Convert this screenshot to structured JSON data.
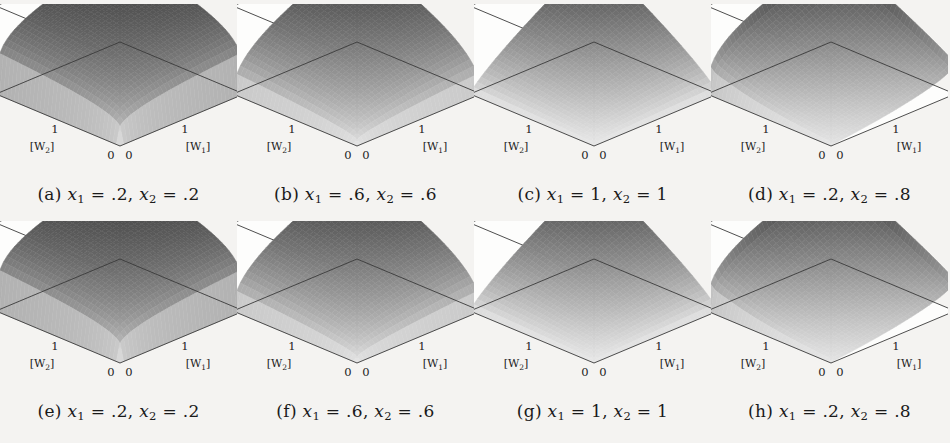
{
  "figure": {
    "background_color": "#f4f3f1",
    "ink_color": "#1a1a1a",
    "rows": 2,
    "cols": 4
  },
  "axes": {
    "zlabel_parts": {
      "num": "|Y|",
      "slash": "/(",
      "x1": "|X",
      "x1sub": "1",
      "plus": "| + |X",
      "x2sub": "2",
      "close": "|)"
    },
    "zlabel_text": "|Y|/(|X1| + |X2|)",
    "z_ticks": [
      "0",
      "0.5",
      "1"
    ],
    "z_tick_values": [
      0,
      0.5,
      1
    ],
    "w1_label_parts": {
      "open": "[W",
      "sub": "1",
      "close": "]"
    },
    "w2_label_parts": {
      "open": "[W",
      "sub": "2",
      "close": "]"
    },
    "w1_label_text": "[W1]",
    "w2_label_text": "[W2]",
    "w1_ticks": [
      "0",
      "1",
      "2"
    ],
    "w2_ticks": [
      "0",
      "1",
      "2"
    ],
    "w_range": [
      0,
      2
    ],
    "z_range": [
      0,
      1
    ]
  },
  "panels": [
    {
      "key": "a",
      "tag": "(a)",
      "x1": ".2",
      "x2": ".2",
      "caption_text": "(a) x1 = .2, x2 = .2",
      "shape": "peaked",
      "surface": {
        "plateau_height": 1.0,
        "valley_height": 0.02,
        "ridge_sharpness": "sharp",
        "asymmetric": false,
        "front_apex_z": 0.0,
        "back_apex_z": 1.0,
        "left_edge_z": [
          0.02,
          1.0
        ],
        "right_edge_z": [
          0.02,
          1.0
        ]
      }
    },
    {
      "key": "b",
      "tag": "(b)",
      "x1": ".6",
      "x2": ".6",
      "caption_text": "(b) x1 = .6, x2 = .6",
      "shape": "rounded-plateau",
      "surface": {
        "plateau_height": 0.98,
        "valley_height": 0.03,
        "ridge_sharpness": "medium",
        "asymmetric": false,
        "front_apex_z": 0.0,
        "back_apex_z": 1.0,
        "left_edge_z": [
          0.03,
          0.95
        ],
        "right_edge_z": [
          0.03,
          0.95
        ]
      }
    },
    {
      "key": "c",
      "tag": "(c)",
      "x1": "1",
      "x2": "1",
      "caption_text": "(c) x1 = 1, x2 = 1",
      "shape": "dome",
      "surface": {
        "plateau_height": 0.95,
        "valley_height": 0.04,
        "ridge_sharpness": "smooth",
        "asymmetric": false,
        "front_apex_z": 0.0,
        "back_apex_z": 1.0,
        "left_edge_z": [
          0.04,
          0.88
        ],
        "right_edge_z": [
          0.04,
          0.88
        ]
      }
    },
    {
      "key": "d",
      "tag": "(d)",
      "x1": ".2",
      "x2": ".8",
      "caption_text": "(d) x1 = .2, x2 = .8",
      "shape": "asymmetric-valley",
      "surface": {
        "plateau_height": 1.0,
        "valley_height": 0.0,
        "ridge_sharpness": "sharp",
        "asymmetric": true,
        "front_apex_z": 0.0,
        "back_apex_z": 1.0,
        "left_edge_z": [
          0.0,
          0.62
        ],
        "right_edge_z": [
          0.0,
          1.0
        ],
        "cutout": true
      }
    },
    {
      "key": "e",
      "tag": "(e)",
      "x1": ".2",
      "x2": ".2",
      "caption_text": "(e) x1 = .2, x2 = .2",
      "shape": "peaked",
      "surface": {
        "plateau_height": 1.0,
        "valley_height": 0.02,
        "ridge_sharpness": "sharp",
        "asymmetric": false,
        "front_apex_z": 0.0,
        "back_apex_z": 1.0,
        "left_edge_z": [
          0.02,
          1.0
        ],
        "right_edge_z": [
          0.02,
          1.0
        ]
      }
    },
    {
      "key": "f",
      "tag": "(f)",
      "x1": ".6",
      "x2": ".6",
      "caption_text": "(f) x1 = .6, x2 = .6",
      "shape": "rounded-plateau",
      "surface": {
        "plateau_height": 0.96,
        "valley_height": 0.04,
        "ridge_sharpness": "medium",
        "asymmetric": false,
        "front_apex_z": 0.0,
        "back_apex_z": 1.0,
        "left_edge_z": [
          0.04,
          0.9
        ],
        "right_edge_z": [
          0.04,
          0.9
        ]
      }
    },
    {
      "key": "g",
      "tag": "(g)",
      "x1": "1",
      "x2": "1",
      "caption_text": "(g) x1 = 1, x2 = 1",
      "shape": "dome",
      "surface": {
        "plateau_height": 0.9,
        "valley_height": 0.05,
        "ridge_sharpness": "smooth",
        "asymmetric": false,
        "front_apex_z": 0.0,
        "back_apex_z": 1.0,
        "left_edge_z": [
          0.05,
          0.8
        ],
        "right_edge_z": [
          0.05,
          0.8
        ]
      }
    },
    {
      "key": "h",
      "tag": "(h)",
      "x1": ".2",
      "x2": ".8",
      "caption_text": "(h) x1 = .2, x2 = .8",
      "shape": "asymmetric-valley",
      "surface": {
        "plateau_height": 1.0,
        "valley_height": 0.0,
        "ridge_sharpness": "sharp",
        "asymmetric": true,
        "front_apex_z": 0.0,
        "back_apex_z": 1.0,
        "left_edge_z": [
          0.0,
          0.6
        ],
        "right_edge_z": [
          0.0,
          1.0
        ],
        "cutout": true
      }
    }
  ],
  "chart_data": {
    "type": "surface",
    "title": "",
    "xlabel": "[W1]",
    "ylabel": "[W2]",
    "zlabel": "|Y|/(|X1| + |X2|)",
    "xlim": [
      0,
      2
    ],
    "ylim": [
      0,
      2
    ],
    "zlim": [
      0,
      1
    ],
    "xticks": [
      0,
      1,
      2
    ],
    "yticks": [
      0,
      1,
      2
    ],
    "zticks": [
      0,
      0.5,
      1
    ],
    "grid": false,
    "legend": "none",
    "colormap": "grayscale-dark-high",
    "panel_count": 8,
    "panels": [
      {
        "key": "a",
        "x1": 0.2,
        "x2": 0.2,
        "peak": 1.0,
        "min": 0.0
      },
      {
        "key": "b",
        "x1": 0.6,
        "x2": 0.6,
        "peak": 1.0,
        "min": 0.0
      },
      {
        "key": "c",
        "x1": 1.0,
        "x2": 1.0,
        "peak": 1.0,
        "min": 0.0
      },
      {
        "key": "d",
        "x1": 0.2,
        "x2": 0.8,
        "peak": 1.0,
        "min": 0.0
      },
      {
        "key": "e",
        "x1": 0.2,
        "x2": 0.2,
        "peak": 1.0,
        "min": 0.0
      },
      {
        "key": "f",
        "x1": 0.6,
        "x2": 0.6,
        "peak": 1.0,
        "min": 0.0
      },
      {
        "key": "g",
        "x1": 1.0,
        "x2": 1.0,
        "peak": 1.0,
        "min": 0.0
      },
      {
        "key": "h",
        "x1": 0.2,
        "x2": 0.8,
        "peak": 1.0,
        "min": 0.0
      }
    ]
  }
}
